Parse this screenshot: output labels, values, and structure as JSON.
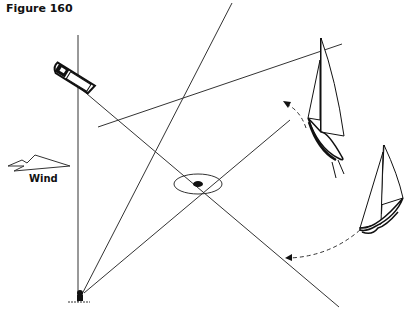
{
  "figure": {
    "title": "Figure 160"
  },
  "labels": {
    "wind": "Wind"
  },
  "elements": {
    "motorboat": "committee-boat",
    "buoy": "marker-buoy",
    "center_mark": "starting-mark",
    "sailboat_1": "sailboat-upper",
    "sailboat_2": "sailboat-lower",
    "wind_arrow": "wind-arrow-icon"
  },
  "colors": {
    "line": "#333333",
    "ink": "#111111",
    "background": "#ffffff"
  }
}
